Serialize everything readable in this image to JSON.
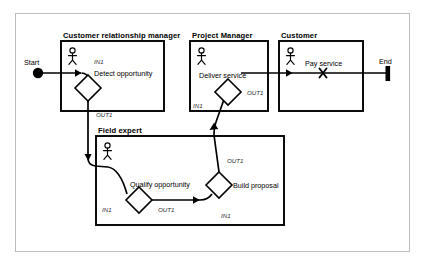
{
  "diagram": {
    "type": "swimlane-activity-diagram",
    "frame": {
      "border_color": "#b9b9b9",
      "background": "#ffffff"
    },
    "stroke_color": "#000000",
    "lanes": [
      {
        "id": "crm",
        "title": "Customer relationship manager",
        "actor_icon": "actor-stick-figure-icon",
        "x": 61,
        "y": 41,
        "w": 103,
        "h": 70,
        "title_x": 63,
        "title_y": 37
      },
      {
        "id": "project-manager",
        "title": "Project Manager",
        "actor_icon": "actor-stick-figure-icon",
        "x": 190,
        "y": 41,
        "w": 78,
        "h": 70,
        "title_x": 192,
        "title_y": 37
      },
      {
        "id": "customer",
        "title": "Customer",
        "actor_icon": "actor-stick-figure-icon",
        "x": 279,
        "y": 41,
        "w": 84,
        "h": 70,
        "title_x": 281,
        "title_y": 37
      },
      {
        "id": "field-expert",
        "title": "Field expert",
        "actor_icon": "actor-stick-figure-icon",
        "x": 96,
        "y": 136,
        "w": 188,
        "h": 89,
        "title_x": 98,
        "title_y": 132
      }
    ],
    "tasks": [
      {
        "id": "detect-opportunity",
        "label": "Detect opportunity",
        "lane": "crm",
        "label_x": 94,
        "label_y": 74,
        "diamond_cx": 88,
        "diamond_cy": 88,
        "diamond_r": 13
      },
      {
        "id": "deliver-service",
        "label": "Deliver service",
        "lane": "project-manager",
        "label_x": 201,
        "label_y": 76,
        "diamond_cx": 228,
        "diamond_cy": 92,
        "diamond_r": 13
      },
      {
        "id": "qualify-opportunity",
        "label": "Qualify opportunity",
        "lane": "field-expert",
        "label_x": 133,
        "label_y": 185,
        "diamond_cx": 139,
        "diamond_cy": 200,
        "diamond_r": 13
      },
      {
        "id": "build-proposal",
        "label": "Build proposal",
        "lane": "field-expert",
        "label_x": 232,
        "label_y": 181,
        "diamond_cx": 219,
        "diamond_cy": 185,
        "diamond_r": 13
      }
    ],
    "ports": [
      {
        "id": "detect-in1",
        "label": "IN1",
        "x": 94,
        "y": 63
      },
      {
        "id": "detect-out1",
        "label": "OUT1",
        "x": 96,
        "y": 115
      },
      {
        "id": "deliver-in1",
        "label": "IN1",
        "x": 194,
        "y": 106
      },
      {
        "id": "deliver-out1",
        "label": "OUT1",
        "x": 248,
        "y": 93
      },
      {
        "id": "qualify-in1",
        "label": "IN1",
        "x": 103,
        "y": 210
      },
      {
        "id": "qualify-out1",
        "label": "OUT1",
        "x": 159,
        "y": 210
      },
      {
        "id": "build-out1",
        "label": "OUT1",
        "x": 228,
        "y": 160
      },
      {
        "id": "build-in1",
        "label": "IN1",
        "x": 222,
        "y": 215
      }
    ],
    "markers": [
      {
        "id": "start-node",
        "kind": "start-circle",
        "label": "Start",
        "cx": 38,
        "cy": 73,
        "r": 5,
        "label_x": 24,
        "label_y": 63
      },
      {
        "id": "end-node",
        "kind": "end-bar",
        "label": "End",
        "cx": 388,
        "cy": 73,
        "label_x": 381,
        "label_y": 63
      },
      {
        "id": "pay-service",
        "kind": "x-cross-marker",
        "label": "Pay service",
        "cx": 323,
        "cy": 73,
        "label_x": 305,
        "label_y": 64
      }
    ],
    "flows": [
      {
        "id": "flow-start-to-detect",
        "from": "start-node",
        "to": "detect-opportunity"
      },
      {
        "id": "flow-detect-to-qualify",
        "from": "detect-opportunity",
        "to": "qualify-opportunity"
      },
      {
        "id": "flow-qualify-to-build",
        "from": "qualify-opportunity",
        "to": "build-proposal"
      },
      {
        "id": "flow-build-to-deliver",
        "from": "build-proposal",
        "to": "deliver-service"
      },
      {
        "id": "flow-deliver-to-end",
        "from": "deliver-service",
        "to": "end-node"
      }
    ]
  }
}
